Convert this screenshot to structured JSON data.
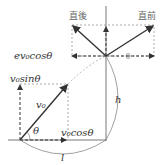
{
  "diagram": {
    "type": "projectile-collision",
    "labels": {
      "after": "直後",
      "before": "直前",
      "ev0cos": "ev₀cosθ",
      "v0sin": "v₀sinθ",
      "v0": "v₀",
      "theta": "θ",
      "v0cos": "v₀cosθ",
      "h": "h",
      "l": "l"
    },
    "colors": {
      "solid": "#333333",
      "dashed": "#888888",
      "text": "#333333",
      "jp_text": "#666666"
    }
  }
}
